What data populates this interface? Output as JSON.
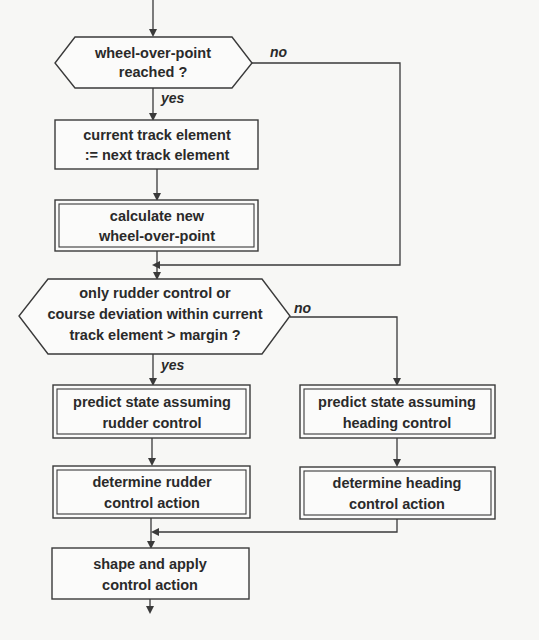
{
  "diagram": {
    "type": "flowchart",
    "nodes": {
      "decision_wop": {
        "shape": "hexagon-decision",
        "lines": [
          "wheel-over-point",
          "reached ?"
        ]
      },
      "step_next_element": {
        "shape": "process",
        "lines": [
          "current track element",
          ":= next track element"
        ]
      },
      "step_calc_wop": {
        "shape": "predefined-process",
        "lines": [
          "calculate new",
          "wheel-over-point"
        ]
      },
      "decision_mode": {
        "shape": "hexagon-decision",
        "lines": [
          "only rudder control or",
          "course deviation within current",
          "track element > margin ?"
        ]
      },
      "predict_rudder": {
        "shape": "predefined-process",
        "lines": [
          "predict state assuming",
          "rudder control"
        ]
      },
      "determine_rudder": {
        "shape": "predefined-process",
        "lines": [
          "determine rudder",
          "control action"
        ]
      },
      "predict_heading": {
        "shape": "predefined-process",
        "lines": [
          "predict state assuming",
          "heading control"
        ]
      },
      "determine_heading": {
        "shape": "predefined-process",
        "lines": [
          "determine heading",
          "control action"
        ]
      },
      "apply_action": {
        "shape": "process",
        "lines": [
          "shape and apply",
          "control action"
        ]
      }
    },
    "edge_labels": {
      "wop_yes": "yes",
      "wop_no": "no",
      "mode_yes": "yes",
      "mode_no": "no"
    },
    "edges": [
      {
        "from": "start",
        "to": "decision_wop"
      },
      {
        "from": "decision_wop",
        "to": "step_next_element",
        "label": "yes"
      },
      {
        "from": "decision_wop",
        "to": "decision_mode",
        "label": "no"
      },
      {
        "from": "step_next_element",
        "to": "step_calc_wop"
      },
      {
        "from": "step_calc_wop",
        "to": "decision_mode"
      },
      {
        "from": "decision_mode",
        "to": "predict_rudder",
        "label": "yes"
      },
      {
        "from": "decision_mode",
        "to": "predict_heading",
        "label": "no"
      },
      {
        "from": "predict_rudder",
        "to": "determine_rudder"
      },
      {
        "from": "predict_heading",
        "to": "determine_heading"
      },
      {
        "from": "determine_rudder",
        "to": "apply_action"
      },
      {
        "from": "determine_heading",
        "to": "apply_action"
      },
      {
        "from": "apply_action",
        "to": "end"
      }
    ],
    "colors": {
      "line": "#3a3a3a",
      "text": "#2a2a2a",
      "background": "#f7f7f5"
    }
  }
}
